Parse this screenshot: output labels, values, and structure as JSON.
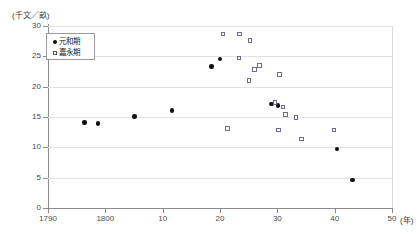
{
  "chart_data": {
    "type": "scatter",
    "title": "",
    "ylabel": "(千文／畝)",
    "xlabel": "(年)",
    "ylim": [
      0,
      30
    ],
    "xlim": [
      1790,
      1850
    ],
    "grid": true,
    "legend_position": "top-left-inside",
    "y_ticks": [
      {
        "value": 30,
        "label": "30"
      },
      {
        "value": 25,
        "label": "25"
      },
      {
        "value": 20,
        "label": "20"
      },
      {
        "value": 15,
        "label": "15"
      },
      {
        "value": 10,
        "label": "10"
      },
      {
        "value": 5,
        "label": "5"
      },
      {
        "value": 0,
        "label": "0"
      }
    ],
    "x_ticks": [
      {
        "value": 1790,
        "label": "1790"
      },
      {
        "value": 1800,
        "label": "1800"
      },
      {
        "value": 1810,
        "label": "10"
      },
      {
        "value": 1820,
        "label": "20"
      },
      {
        "value": 1830,
        "label": "30"
      },
      {
        "value": 1840,
        "label": "40"
      },
      {
        "value": 1850,
        "label": "50"
      }
    ],
    "series": [
      {
        "name": "元和期",
        "marker": "filled-circle",
        "color": "#111111",
        "points": [
          {
            "x": 1796.4,
            "y": 14.1
          },
          {
            "x": 1798.7,
            "y": 13.9
          },
          {
            "x": 1805.1,
            "y": 15.1
          },
          {
            "x": 1811.6,
            "y": 16.1
          },
          {
            "x": 1818.5,
            "y": 23.3
          },
          {
            "x": 1820.0,
            "y": 24.6
          },
          {
            "x": 1829.0,
            "y": 17.1
          },
          {
            "x": 1830.1,
            "y": 16.9
          },
          {
            "x": 1840.4,
            "y": 9.7
          },
          {
            "x": 1843.1,
            "y": 4.6
          }
        ]
      },
      {
        "name": "嘉永期",
        "marker": "open-square",
        "color": "#6b6b8a",
        "points": [
          {
            "x": 1820.5,
            "y": 28.7
          },
          {
            "x": 1823.4,
            "y": 28.7
          },
          {
            "x": 1825.2,
            "y": 27.6
          },
          {
            "x": 1823.3,
            "y": 24.7
          },
          {
            "x": 1826.0,
            "y": 22.8
          },
          {
            "x": 1826.9,
            "y": 23.5
          },
          {
            "x": 1830.4,
            "y": 22.0
          },
          {
            "x": 1825.1,
            "y": 21.0
          },
          {
            "x": 1821.3,
            "y": 13.1
          },
          {
            "x": 1829.6,
            "y": 17.4
          },
          {
            "x": 1831.0,
            "y": 16.6
          },
          {
            "x": 1831.4,
            "y": 15.4
          },
          {
            "x": 1833.3,
            "y": 14.9
          },
          {
            "x": 1830.2,
            "y": 12.9
          },
          {
            "x": 1834.2,
            "y": 11.4
          },
          {
            "x": 1839.9,
            "y": 12.9
          }
        ]
      }
    ]
  },
  "legend": {
    "entries": [
      {
        "label": "元和期",
        "marker": "filled-circle"
      },
      {
        "label": "嘉永期",
        "marker": "open-square"
      }
    ]
  }
}
